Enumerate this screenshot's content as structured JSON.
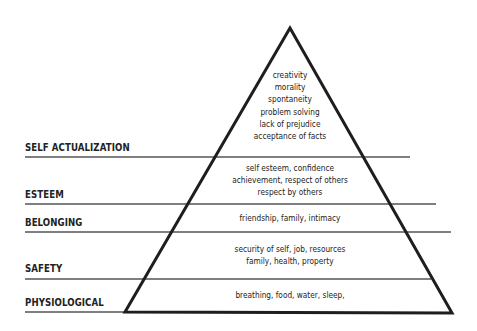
{
  "diagram": {
    "type": "pyramid",
    "levels": [
      {
        "name": "SELF ACTUALIZATION",
        "items": [
          "creativity",
          "morality",
          "spontaneity",
          "problem solving",
          "lack of prejudice",
          "acceptance of facts"
        ]
      },
      {
        "name": "ESTEEM",
        "items": [
          "self esteem, confidence",
          "achievement, respect of others",
          "respect by others"
        ]
      },
      {
        "name": "BELONGING",
        "items": [
          "friendship, family, intimacy"
        ]
      },
      {
        "name": "SAFETY",
        "items": [
          "security of self, job, resources",
          "family, health, property"
        ]
      },
      {
        "name": "PHYSIOLOGICAL",
        "items": [
          "breathing,  food, water, sleep,"
        ]
      }
    ]
  },
  "colors": {
    "line": "#222222",
    "divider": "#555555",
    "text": "#222222",
    "background": "#ffffff"
  }
}
